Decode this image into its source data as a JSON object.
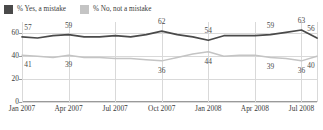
{
  "legend": {
    "items": [
      {
        "label": "% Yes, a mistake",
        "color": "#4a4a4a",
        "swatch": "legend-swatch-yes"
      },
      {
        "label": "% No, not a mistake",
        "color": "#c4c4c4",
        "swatch": "legend-swatch-no"
      }
    ]
  },
  "chart_data": {
    "type": "line",
    "title": "",
    "xlabel": "",
    "ylabel": "",
    "ylim": [
      0,
      70
    ],
    "yticks": [
      0,
      20,
      40,
      60
    ],
    "grid": true,
    "legend_position": "top-left",
    "categories": [
      "Jan 2007",
      "Feb 2007",
      "Mar 2007",
      "Apr 2007",
      "May 2007",
      "Jun 2007",
      "Jul 2007",
      "Aug 2007",
      "Sep 2007",
      "Oct 2007",
      "Nov 2007",
      "Dec 2007",
      "Jan 2008",
      "Feb 2008",
      "Mar 2008",
      "Apr 2008",
      "May 2008",
      "Jun 2008",
      "Jul 2008",
      "Aug 2008"
    ],
    "xticks": [
      "Jan 2007",
      "Apr 2007",
      "Jul 2007",
      "Oct 2007",
      "Jan 2008",
      "Apr 2008",
      "Jul 2008"
    ],
    "series": [
      {
        "name": "% Yes, a mistake",
        "color": "#4a4a4a",
        "values": [
          57,
          56,
          58,
          59,
          57,
          57,
          58,
          57,
          59,
          62,
          59,
          57,
          54,
          58,
          58,
          58,
          59,
          61,
          63,
          56
        ],
        "labels": [
          {
            "index": 0,
            "value": "57"
          },
          {
            "index": 3,
            "value": "59"
          },
          {
            "index": 9,
            "value": "62"
          },
          {
            "index": 12,
            "value": "54"
          },
          {
            "index": 16,
            "value": "59"
          },
          {
            "index": 18,
            "value": "63"
          },
          {
            "index": 19,
            "value": "56"
          }
        ]
      },
      {
        "name": "% No, not a mistake",
        "color": "#c4c4c4",
        "values": [
          41,
          40,
          39,
          41,
          39,
          39,
          38,
          38,
          37,
          36,
          39,
          42,
          44,
          40,
          41,
          41,
          39,
          38,
          36,
          40
        ],
        "labels": [
          {
            "index": 0,
            "value": "41"
          },
          {
            "index": 3,
            "value": "39"
          },
          {
            "index": 9,
            "value": "36"
          },
          {
            "index": 12,
            "value": "44"
          },
          {
            "index": 16,
            "value": "39"
          },
          {
            "index": 18,
            "value": "36"
          },
          {
            "index": 19,
            "value": "40"
          }
        ]
      }
    ]
  }
}
